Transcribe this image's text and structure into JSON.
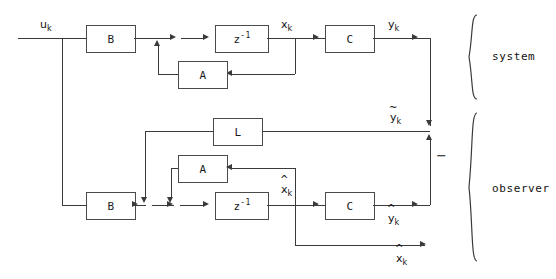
{
  "diagram": {
    "sections": [
      {
        "id": "system",
        "label": "system"
      },
      {
        "id": "observer",
        "label": "observer"
      }
    ],
    "blocks": [
      {
        "id": "b-sys",
        "label": "B",
        "section": "system"
      },
      {
        "id": "z-sys",
        "label": "z",
        "exponent": "-1",
        "section": "system"
      },
      {
        "id": "a-sys",
        "label": "A",
        "section": "system"
      },
      {
        "id": "c-sys",
        "label": "C",
        "section": "system"
      },
      {
        "id": "l-obs",
        "label": "L",
        "section": "observer"
      },
      {
        "id": "b-obs",
        "label": "B",
        "section": "observer"
      },
      {
        "id": "a-obs",
        "label": "A",
        "section": "observer"
      },
      {
        "id": "z-obs",
        "label": "z",
        "exponent": "-1",
        "section": "observer"
      },
      {
        "id": "c-obs",
        "label": "C",
        "section": "observer"
      }
    ],
    "signals": [
      {
        "id": "u",
        "base": "u",
        "sub": "k",
        "accent": "none",
        "text": "u"
      },
      {
        "id": "x",
        "base": "x",
        "sub": "k",
        "accent": "none",
        "text": "x"
      },
      {
        "id": "y",
        "base": "y",
        "sub": "k",
        "accent": "none",
        "text": "y"
      },
      {
        "id": "ytilde",
        "base": "y",
        "sub": "k",
        "accent": "tilde",
        "text": "y"
      },
      {
        "id": "xhat",
        "base": "x",
        "sub": "k",
        "accent": "hat",
        "text": "x"
      },
      {
        "id": "yhat",
        "base": "y",
        "sub": "k",
        "accent": "hat",
        "text": "y"
      }
    ],
    "signs": [
      {
        "id": "sum-minus",
        "label": "−"
      }
    ],
    "accent_glyphs": {
      "hat": "^",
      "tilde": "~",
      "none": ""
    },
    "colors": {
      "line": "#3a3a3a",
      "box_border": "#4a4a4a",
      "text": "#111111",
      "background": "#ffffff"
    }
  }
}
